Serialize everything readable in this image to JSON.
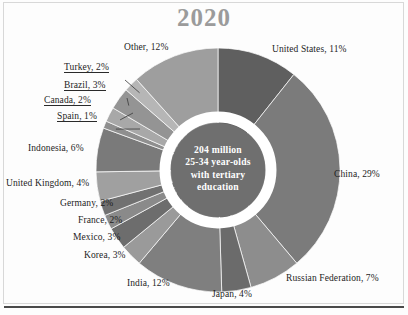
{
  "figure": {
    "title": "2020",
    "title_color": "#9b9b9b",
    "background_color": "#fdfdfd",
    "frame_color": "#d8d8d8",
    "bottom_rule_color": "#4a4a4a"
  },
  "center": {
    "line1": "204 million",
    "line2": "25-34 year-olds",
    "line3": "with tertiary",
    "line4": "education",
    "fill_color": "#6f6f6f",
    "ring_color": "#ffffff",
    "text_color": "#ffffff"
  },
  "chart_data": {
    "type": "pie",
    "title": "2020",
    "subtitle": "204 million 25-34 year-olds with tertiary education",
    "xlabel": "",
    "ylabel": "",
    "units": "percent",
    "total_label": "204 million",
    "donut": true,
    "start_angle_deg": 0,
    "direction": "clockwise",
    "legend": "labels-outside",
    "grid": false,
    "categories": [
      "United States",
      "China",
      "Russian Federation",
      "Japan",
      "India",
      "Korea",
      "Mexico",
      "France",
      "Germany",
      "United Kingdom",
      "Indonesia",
      "Spain",
      "Canada",
      "Brazil",
      "Turkey",
      "Other"
    ],
    "values": [
      11,
      29,
      7,
      4,
      12,
      3,
      3,
      2,
      2,
      4,
      6,
      1,
      2,
      3,
      2,
      12
    ],
    "colors": [
      "#5f5f5f",
      "#7b7b7b",
      "#8d8d8d",
      "#6b6b6b",
      "#7f7f7f",
      "#9a9a9a",
      "#6d6d6d",
      "#8a8a8a",
      "#717171",
      "#a0a0a0",
      "#7a7a7a",
      "#8f8f8f",
      "#a8a8a8",
      "#949494",
      "#b6b6b6",
      "#9e9e9e"
    ],
    "slices": [
      {
        "label": "United States, 11%",
        "name": "United States",
        "value": 11,
        "color": "#5f5f5f"
      },
      {
        "label": "China, 29%",
        "name": "China",
        "value": 29,
        "color": "#7b7b7b"
      },
      {
        "label": "Russian Federation, 7%",
        "name": "Russian Federation",
        "value": 7,
        "color": "#8d8d8d"
      },
      {
        "label": "Japan, 4%",
        "name": "Japan",
        "value": 4,
        "color": "#6b6b6b"
      },
      {
        "label": "India, 12%",
        "name": "India",
        "value": 12,
        "color": "#7f7f7f"
      },
      {
        "label": "Korea, 3%",
        "name": "Korea",
        "value": 3,
        "color": "#9a9a9a"
      },
      {
        "label": "Mexico, 3%",
        "name": "Mexico",
        "value": 3,
        "color": "#6d6d6d"
      },
      {
        "label": "France, 2%",
        "name": "France",
        "value": 2,
        "color": "#8a8a8a"
      },
      {
        "label": "Germany, 2%",
        "name": "Germany",
        "value": 2,
        "color": "#717171"
      },
      {
        "label": "United Kingdom, 4%",
        "name": "United Kingdom",
        "value": 4,
        "color": "#a0a0a0"
      },
      {
        "label": "Indonesia, 6%",
        "name": "Indonesia",
        "value": 6,
        "color": "#7a7a7a"
      },
      {
        "label": "Spain, 1%",
        "name": "Spain",
        "value": 1,
        "color": "#8f8f8f"
      },
      {
        "label": "Canada, 2%",
        "name": "Canada",
        "value": 2,
        "color": "#a8a8a8"
      },
      {
        "label": "Brazil, 3%",
        "name": "Brazil",
        "value": 3,
        "color": "#949494"
      },
      {
        "label": "Turkey, 2%",
        "name": "Turkey",
        "value": 2,
        "color": "#b6b6b6"
      },
      {
        "label": "Other, 12%",
        "name": "Other",
        "value": 12,
        "color": "#9e9e9e"
      }
    ]
  },
  "labels": {
    "united_states": "United States, 11%",
    "china": "China, 29%",
    "russian_federation": "Russian Federation, 7%",
    "japan": "Japan, 4%",
    "india": "India, 12%",
    "korea": "Korea, 3%",
    "mexico": "Mexico, 3%",
    "france": "France, 2%",
    "germany": "Germany, 2%",
    "united_kingdom": "United Kingdom, 4%",
    "indonesia": "Indonesia, 6%",
    "spain": "Spain, 1%",
    "canada": "Canada, 2%",
    "brazil": "Brazil, 3%",
    "turkey": "Turkey, 2%",
    "other": "Other, 12%"
  }
}
